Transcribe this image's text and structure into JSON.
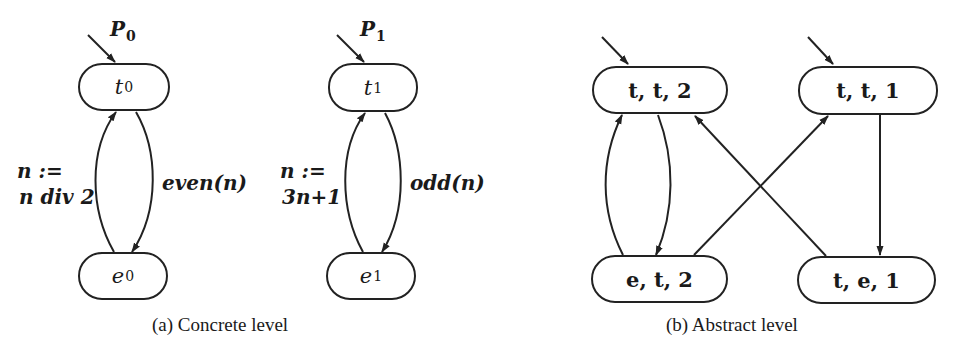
{
  "diagram": {
    "concrete": {
      "caption": "(a) Concrete level",
      "processes": [
        {
          "initial_label": "P",
          "initial_sub": "0",
          "top_node": {
            "name": "t",
            "sub": "0"
          },
          "bottom_node": {
            "name": "e",
            "sub": "0"
          },
          "edge_down_label": "even(n)",
          "edge_up_label_line1": "n :=",
          "edge_up_label_line2": "n div 2"
        },
        {
          "initial_label": "P",
          "initial_sub": "1",
          "top_node": {
            "name": "t",
            "sub": "1"
          },
          "bottom_node": {
            "name": "e",
            "sub": "1"
          },
          "edge_down_label": "odd(n)",
          "edge_up_label_line1": "n :=",
          "edge_up_label_line2": "3n+1"
        }
      ]
    },
    "abstract": {
      "caption": "(b) Abstract level",
      "nodes": {
        "tt2": "t, t, 2",
        "tt1": "t, t, 1",
        "et2": "e, t, 2",
        "te1": "t, e, 1"
      },
      "initial_nodes": [
        "t, t, 2",
        "t, t, 1"
      ],
      "edges": [
        {
          "from": "t, t, 2",
          "to": "e, t, 2"
        },
        {
          "from": "e, t, 2",
          "to": "t, t, 2"
        },
        {
          "from": "e, t, 2",
          "to": "t, t, 1"
        },
        {
          "from": "t, e, 1",
          "to": "t, t, 2"
        },
        {
          "from": "t, t, 1",
          "to": "t, e, 1"
        }
      ]
    }
  }
}
